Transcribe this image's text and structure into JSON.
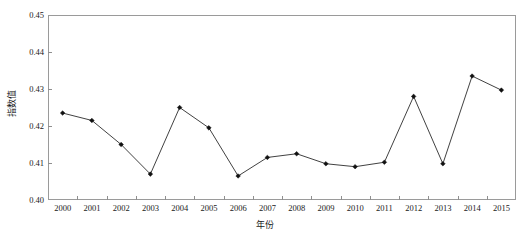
{
  "chart_data": {
    "type": "line",
    "title": "",
    "xlabel": "年份",
    "ylabel": "指数值",
    "categories": [
      "2000",
      "2001",
      "2002",
      "2003",
      "2004",
      "2005",
      "2006",
      "2007",
      "2008",
      "2009",
      "2010",
      "2011",
      "2012",
      "2013",
      "2014",
      "2015"
    ],
    "values": [
      0.4235,
      0.4215,
      0.415,
      0.407,
      0.425,
      0.4195,
      0.4065,
      0.4115,
      0.4125,
      0.4098,
      0.409,
      0.4102,
      0.428,
      0.4098,
      0.4335,
      0.4297
    ],
    "series": [
      {
        "name": "指数值",
        "values": [
          0.4235,
          0.4215,
          0.415,
          0.407,
          0.425,
          0.4195,
          0.4065,
          0.4115,
          0.4125,
          0.4098,
          0.409,
          0.4102,
          0.428,
          0.4098,
          0.4335,
          0.4297
        ]
      }
    ],
    "ylim": [
      0.4,
      0.45
    ],
    "ytick_labels": [
      "0.45",
      "0.44",
      "0.43",
      "0.42",
      "0.41",
      "0.40"
    ],
    "ytick_values": [
      0.45,
      0.44,
      0.43,
      0.42,
      0.41,
      0.4
    ],
    "xlim": [
      "2000",
      "2015"
    ],
    "grid": false,
    "legend": "none",
    "marker": "diamond",
    "line_color": "#2b2b2b",
    "marker_color": "#111111",
    "frame_color": "#9a9a9a",
    "background": "#ffffff"
  }
}
